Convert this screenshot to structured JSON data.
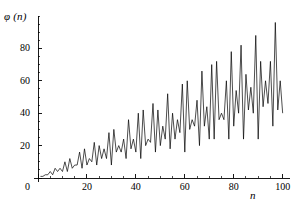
{
  "chart_data": {
    "type": "line",
    "title": "",
    "subtitle": "",
    "xlabel": "n",
    "ylabel": "φ (n)",
    "xlim": [
      0,
      103
    ],
    "ylim": [
      0,
      100
    ],
    "xticks": [
      0,
      20,
      40,
      60,
      80,
      100
    ],
    "xtick_labels": [
      "0",
      "20",
      "40",
      "60",
      "80",
      "100"
    ],
    "yticks": [
      0,
      20,
      40,
      60,
      80
    ],
    "ytick_labels": [
      "0",
      "20",
      "40",
      "60",
      "80"
    ],
    "minor_tick_step_x": 5,
    "minor_tick_step_y": 5,
    "grid": false,
    "legend": "none",
    "line_color": "#000000",
    "line_width": 0.7,
    "background_color": "#ffffff",
    "axis_color": "#000000",
    "series": [
      {
        "name": "φ (n)",
        "x": [
          1,
          2,
          3,
          4,
          5,
          6,
          7,
          8,
          9,
          10,
          11,
          12,
          13,
          14,
          15,
          16,
          17,
          18,
          19,
          20,
          21,
          22,
          23,
          24,
          25,
          26,
          27,
          28,
          29,
          30,
          31,
          32,
          33,
          34,
          35,
          36,
          37,
          38,
          39,
          40,
          41,
          42,
          43,
          44,
          45,
          46,
          47,
          48,
          49,
          50,
          51,
          52,
          53,
          54,
          55,
          56,
          57,
          58,
          59,
          60,
          61,
          62,
          63,
          64,
          65,
          66,
          67,
          68,
          69,
          70,
          71,
          72,
          73,
          74,
          75,
          76,
          77,
          78,
          79,
          80,
          81,
          82,
          83,
          84,
          85,
          86,
          87,
          88,
          89,
          90,
          91,
          92,
          93,
          94,
          95,
          96,
          97,
          98,
          99,
          100
        ],
        "values": [
          1,
          1,
          2,
          2,
          4,
          2,
          6,
          4,
          6,
          4,
          10,
          4,
          12,
          6,
          8,
          8,
          16,
          6,
          18,
          8,
          12,
          10,
          22,
          8,
          20,
          12,
          18,
          12,
          28,
          8,
          30,
          16,
          20,
          16,
          24,
          12,
          36,
          18,
          24,
          16,
          40,
          12,
          42,
          20,
          24,
          22,
          46,
          16,
          42,
          20,
          32,
          24,
          52,
          18,
          40,
          24,
          36,
          28,
          58,
          16,
          60,
          30,
          36,
          32,
          48,
          20,
          66,
          32,
          44,
          24,
          70,
          24,
          72,
          36,
          40,
          36,
          60,
          24,
          78,
          32,
          54,
          40,
          82,
          24,
          64,
          42,
          56,
          40,
          88,
          24,
          72,
          44,
          60,
          46,
          72,
          32,
          96,
          42,
          60,
          40
        ]
      }
    ]
  }
}
